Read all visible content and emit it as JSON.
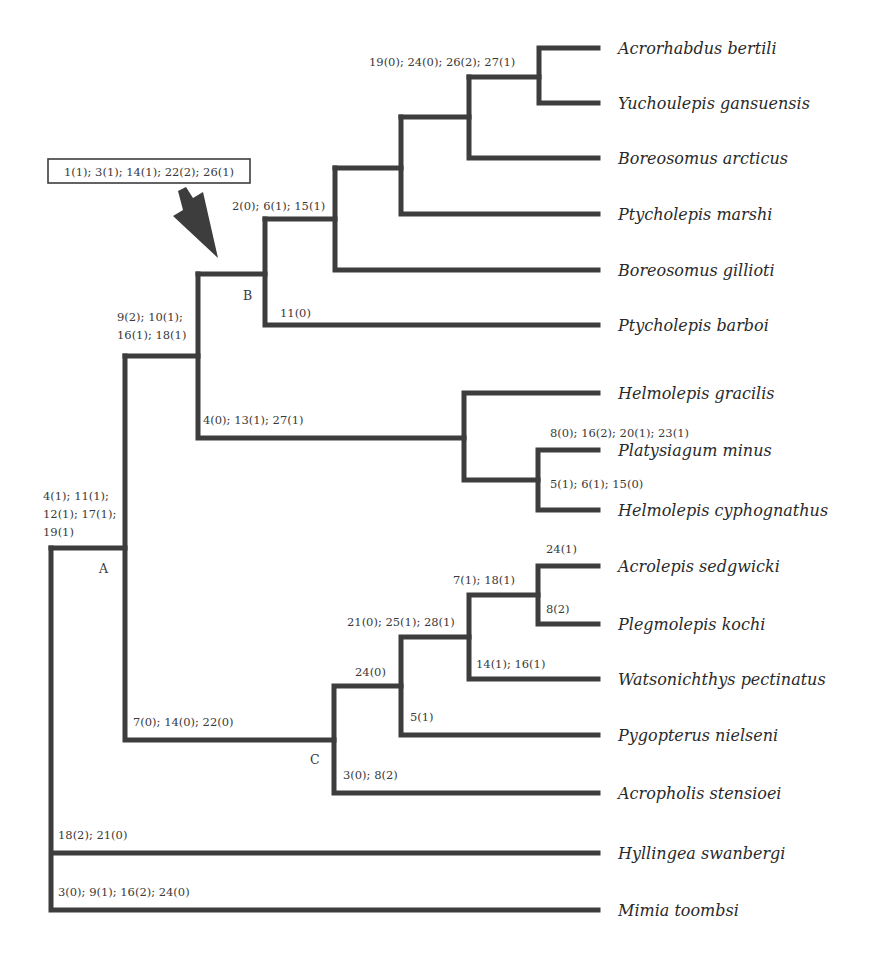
{
  "figure": {
    "type": "cladogram",
    "taxa": [
      "Acrorhabdus bertili",
      "Yuchoulepis gansuensis",
      "Boreosomus arcticus",
      "Ptycholepis marshi",
      "Boreosomus gillioti",
      "Ptycholepis barboi",
      "Helmolepis gracilis",
      "Platysiagum minus",
      "Helmolepis cyphognathus",
      "Acrolepis sedgwicki",
      "Plegmolepis kochi",
      "Watsonichthys pectinatus",
      "Pygopterus nielseni",
      "Acropholis stensioei",
      "Hyllingea swanbergi",
      "Mimia toombsi"
    ],
    "node_labels": {
      "A": "A",
      "B": "B",
      "C": "C"
    },
    "callout_box": "1(1); 3(1); 14(1); 22(2); 26(1)",
    "characters": {
      "acrorhabdus_yuchoulepis": "19(0); 24(0); 26(2); 27(1)",
      "clade_B_inner": "2(0); 6(1); 15(1)",
      "ptycholepis_barboi": "11(0)",
      "A_upper_1": "9(2); 10(1);",
      "A_upper_2": "16(1); 18(1)",
      "helmolepis_clade": "4(0); 13(1); 27(1)",
      "platysiagum": "8(0); 16(2); 20(1); 23(1)",
      "helmolepis_cyphognathus": "5(1); 6(1); 15(0)",
      "A_1": "4(1); 11(1);",
      "A_2": "12(1); 17(1);",
      "A_3": "19(1)",
      "acrolepis": "24(1)",
      "acrolepis_plegmolepis": "7(1); 18(1)",
      "plegmolepis": "8(2)",
      "clade_21": "21(0); 25(1); 28(1)",
      "watsonichthys": "14(1); 16(1)",
      "clade_24": "24(0)",
      "pygopterus": "5(1)",
      "clade_C": "7(0); 14(0); 22(0)",
      "acropholis": "3(0); 8(2)",
      "hyllingea": "18(2); 21(0)",
      "mimia": "3(0); 9(1); 16(2); 24(0)"
    },
    "colors": {
      "branch": "#3d3d3d",
      "text": "#2a2a2a"
    }
  }
}
